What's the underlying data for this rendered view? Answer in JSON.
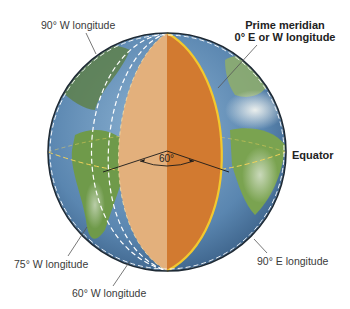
{
  "diagram": {
    "labels": {
      "w90": "90° W longitude",
      "prime_line1": "Prime meridian",
      "prime_line2": "0° E or W longitude",
      "equator": "Equator",
      "w75": "75° W longitude",
      "w60": "60° W longitude",
      "e90": "90° E longitude",
      "angle": "60°"
    },
    "colors": {
      "ocean": "#5a86b0",
      "land": "#6f9a4a",
      "wedge_left": "#e3b07c",
      "wedge_right": "#d27a30",
      "prime_meridian": "#f2c82e",
      "equator_line": "#f3d35a",
      "dash": "#ffffff",
      "outline": "#1e2a35"
    }
  }
}
